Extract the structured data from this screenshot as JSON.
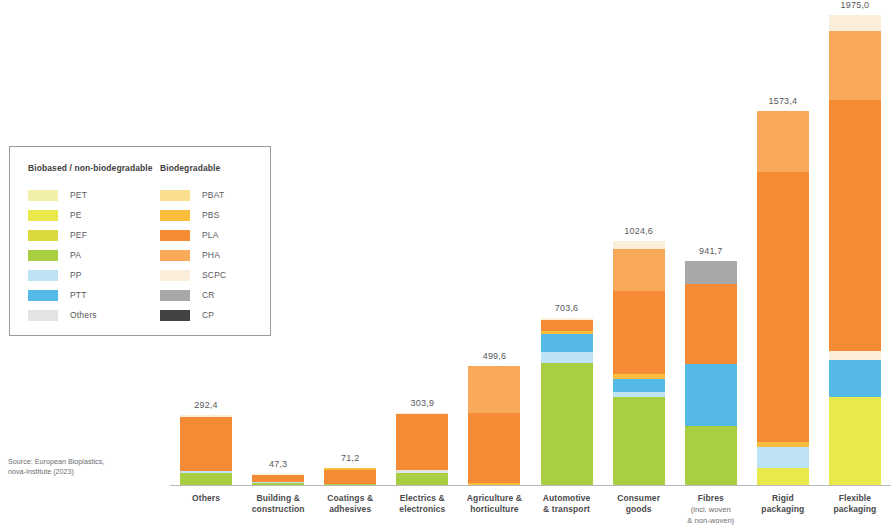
{
  "source_note": "Source: European Bioplastics,\nnova-Institute (2023)",
  "legend": {
    "columns": [
      {
        "heading": "Biobased / non-biodegradable",
        "items": [
          {
            "label": "PET",
            "color": "#f2f0a8"
          },
          {
            "label": "PE",
            "color": "#eae94c"
          },
          {
            "label": "PEF",
            "color": "#dada3e"
          },
          {
            "label": "PA",
            "color": "#a8cf41"
          },
          {
            "label": "PP",
            "color": "#bde3f5"
          },
          {
            "label": "PTT",
            "color": "#55b9e8"
          },
          {
            "label": "Others",
            "color": "#e3e3e3"
          }
        ]
      },
      {
        "heading": "Biodegradable",
        "items": [
          {
            "label": "PBAT",
            "color": "#fbdf8f"
          },
          {
            "label": "PBS",
            "color": "#fbbd3c"
          },
          {
            "label": "PLA",
            "color": "#f68b35"
          },
          {
            "label": "PHA",
            "color": "#f9a košice"
          },
          {
            "label": "SCPC",
            "color": "#faeedb"
          },
          {
            "label": "CR",
            "color": "#a8a8a8"
          },
          {
            "label": "CP",
            "color": "#434343"
          }
        ]
      }
    ]
  },
  "chart_data": {
    "type": "bar",
    "subtype": "stacked-bar",
    "title": "",
    "xlabel": "",
    "ylabel": "",
    "ylim": [
      0,
      1975
    ],
    "grid": false,
    "legend_position": "left",
    "value_decimal_separator": ",",
    "colors": {
      "PET": "#f2f0a8",
      "PE": "#eae94c",
      "PEF": "#dada3e",
      "PA": "#a8cf41",
      "PP": "#bde3f5",
      "PTT": "#55b9e8",
      "Others": "#e3e3e3",
      "PBAT": "#fbdf8f",
      "PBS": "#fbbd3c",
      "PLA": "#f68b35",
      "PHA": "#f9a95a",
      "SCPC": "#faeedb",
      "CR": "#a8a8a8",
      "CP": "#434343"
    },
    "categories": [
      "Others",
      "Building &\nconstruction",
      "Coatings &\nadhesives",
      "Electrics &\nelectronics",
      "Agriculture &\nhorticulture",
      "Automotive\n& transport",
      "Consumer\ngoods",
      "Fibres\n(incl. woven\n& non-woven)",
      "Rigid\npackaging",
      "Flexible\npackaging"
    ],
    "totals": [
      292.4,
      47.3,
      71.2,
      303.9,
      499.6,
      703.6,
      1024.6,
      941.7,
      1573.4,
      1975.0
    ],
    "total_labels": [
      "292,4",
      "47,3",
      "71,2",
      "303,9",
      "499,6",
      "703,6",
      "1024,6",
      "941,7",
      "1573,4",
      "1975,0"
    ],
    "bars": [
      {
        "category": "Others",
        "total": 292.4,
        "label": "292,4",
        "segments": [
          {
            "name": "PA",
            "value": 50
          },
          {
            "name": "PP",
            "value": 10
          },
          {
            "name": "PLA",
            "value": 225
          },
          {
            "name": "SCPC",
            "value": 7
          }
        ]
      },
      {
        "category": "Building & construction",
        "total": 47.3,
        "label": "47,3",
        "segments": [
          {
            "name": "PA",
            "value": 8
          },
          {
            "name": "PP",
            "value": 5
          },
          {
            "name": "PLA",
            "value": 30
          },
          {
            "name": "SCPC",
            "value": 4
          }
        ]
      },
      {
        "category": "Coatings & adhesives",
        "total": 71.2,
        "label": "71,2",
        "segments": [
          {
            "name": "PA",
            "value": 6
          },
          {
            "name": "PLA",
            "value": 58
          },
          {
            "name": "PBS",
            "value": 7
          }
        ]
      },
      {
        "category": "Electrics & electronics",
        "total": 303.9,
        "label": "303,9",
        "segments": [
          {
            "name": "PA",
            "value": 52
          },
          {
            "name": "Others",
            "value": 12
          },
          {
            "name": "PLA",
            "value": 234
          },
          {
            "name": "SCPC",
            "value": 6
          }
        ]
      },
      {
        "category": "Agriculture & horticulture",
        "total": 499.6,
        "label": "499,6",
        "segments": [
          {
            "name": "PBS",
            "value": 8
          },
          {
            "name": "PLA",
            "value": 295
          },
          {
            "name": "PHA",
            "value": 197
          }
        ]
      },
      {
        "category": "Automotive & transport",
        "total": 703.6,
        "label": "703,6",
        "segments": [
          {
            "name": "PA",
            "value": 515
          },
          {
            "name": "PP",
            "value": 45
          },
          {
            "name": "PTT",
            "value": 75
          },
          {
            "name": "PBS",
            "value": 12
          },
          {
            "name": "PLA",
            "value": 48
          },
          {
            "name": "SCPC",
            "value": 9
          }
        ]
      },
      {
        "category": "Consumer goods",
        "total": 1024.6,
        "label": "1024,6",
        "segments": [
          {
            "name": "PA",
            "value": 370
          },
          {
            "name": "PP",
            "value": 22
          },
          {
            "name": "PTT",
            "value": 55
          },
          {
            "name": "PBS",
            "value": 20
          },
          {
            "name": "PLA",
            "value": 350
          },
          {
            "name": "PHA",
            "value": 175
          },
          {
            "name": "SCPC",
            "value": 32
          }
        ]
      },
      {
        "category": "Fibres (incl. woven & non-woven)",
        "total": 941.7,
        "label": "941,7",
        "segments": [
          {
            "name": "PA",
            "value": 250
          },
          {
            "name": "PTT",
            "value": 260
          },
          {
            "name": "PLA",
            "value": 335
          },
          {
            "name": "CR",
            "value": 97
          }
        ]
      },
      {
        "category": "Rigid packaging",
        "total": 1573.4,
        "label": "1573,4",
        "segments": [
          {
            "name": "PE",
            "value": 72
          },
          {
            "name": "PP",
            "value": 88
          },
          {
            "name": "PBS",
            "value": 22
          },
          {
            "name": "PLA",
            "value": 1135
          },
          {
            "name": "PHA",
            "value": 256
          }
        ]
      },
      {
        "category": "Flexible packaging",
        "total": 1975.0,
        "label": "1975,0",
        "segments": [
          {
            "name": "PE",
            "value": 370
          },
          {
            "name": "PTT",
            "value": 155
          },
          {
            "name": "SCPC",
            "value": 40
          },
          {
            "name": "PLA",
            "value": 1055
          },
          {
            "name": "PHA",
            "value": 290
          },
          {
            "name": "SCPC2",
            "value": 65
          }
        ]
      }
    ]
  }
}
